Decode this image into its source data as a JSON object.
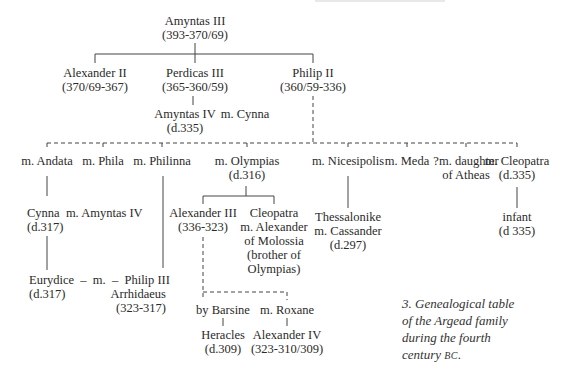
{
  "diagram": {
    "type": "genealogical-tree",
    "caption": {
      "lines": [
        "3. Genealogical table",
        "of the Argead family",
        "during the fourth"
      ],
      "last_line_prefix": "century ",
      "last_line_smallcaps": "BC",
      "last_line_suffix": "."
    },
    "nodes": {
      "amyntas3": {
        "name": "Amyntas III",
        "dates": "(393-370/69)"
      },
      "alexander2": {
        "name": "Alexander II",
        "dates": "(370/69-367)"
      },
      "perdicas3": {
        "name": "Perdicas III",
        "dates": "(365-360/59)"
      },
      "philip2": {
        "name": "Philip II",
        "dates": "(360/59-336)"
      },
      "amyntas4": {
        "name": "Amyntas IV",
        "spouse": "m. Cynna",
        "dates": "(d.335)"
      },
      "andata": {
        "name": "m. Andata"
      },
      "phila": {
        "name": "m. Phila"
      },
      "philinna": {
        "name": "m. Philinna"
      },
      "olympias": {
        "name": "m. Olympias",
        "dates": "(d.316)"
      },
      "nicesipolis": {
        "name": "m. Nicesipolis"
      },
      "meda": {
        "name": "m. Meda"
      },
      "atheas": {
        "name": "?m. daughter",
        "line2": "of Atheas"
      },
      "cleopatra_wife": {
        "name": "m. Cleopatra",
        "dates": "(d.335)"
      },
      "cynna": {
        "name": "Cynna  m. Amyntas IV",
        "dates": "(d.317)"
      },
      "alexander3": {
        "name": "Alexander III",
        "dates": "(336-323)"
      },
      "cleopatra_daughter": {
        "lines": [
          "Cleopatra",
          "m. Alexander",
          "of Molossia",
          "(brother of",
          "Olympias)"
        ]
      },
      "thessalonike": {
        "name": "Thessalonike",
        "line2": "m. Cassander",
        "dates": "(d.297)"
      },
      "infant": {
        "name": "infant",
        "dates": "(d 335)"
      },
      "eurydice": {
        "name": "Eurydice  –  m.  –  Philip III",
        "dates": "(d.317)",
        "line2": "Arrhidaeus",
        "line3": "(323-317)"
      },
      "barsine": {
        "name": "by Barsine"
      },
      "roxane": {
        "name": "m. Roxane"
      },
      "heracles": {
        "name": "Heracles",
        "dates": "(d.309)"
      },
      "alexander4": {
        "name": "Alexander IV",
        "dates": "(323-310/309)"
      }
    }
  }
}
